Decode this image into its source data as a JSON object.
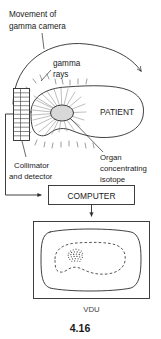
{
  "figure": {
    "caption": "4.16",
    "labels": {
      "movement_line1": "Movement of",
      "movement_line2": "gamma camera",
      "gamma_line1": "gamma",
      "gamma_line2": "rays",
      "patient": "PATIENT",
      "collimator_line1": "Collimator",
      "collimator_line2": "and detector",
      "organ_line1": "Organ",
      "organ_line2": "concentrating",
      "organ_line3": "isotope",
      "computer": "COMPUTER",
      "vdu": "VDU"
    },
    "colors": {
      "ink": "#2b2b2b",
      "organ_fill": "#d8d8d8",
      "ray": "#4a4a4a",
      "background": "#ffffff"
    },
    "icons": {
      "movement_arc": "curved-arrow-icon",
      "signal_arrow": "right-arrow-icon",
      "output_arrow": "down-arrow-icon"
    }
  }
}
